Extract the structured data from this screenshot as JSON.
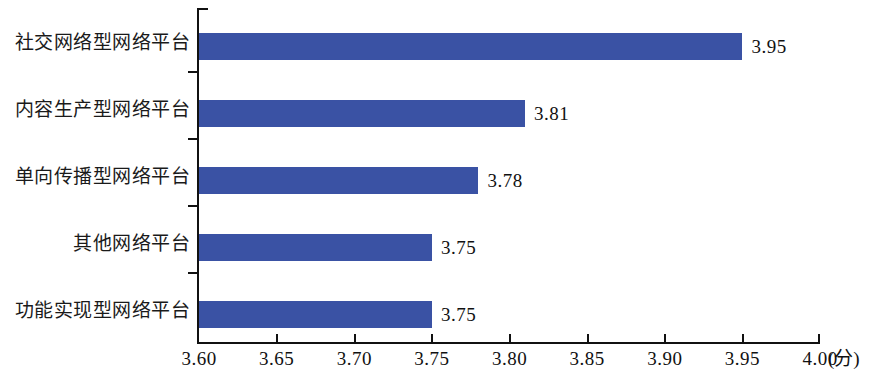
{
  "chart_data": {
    "type": "bar",
    "orientation": "horizontal",
    "title": "",
    "subtitle": "",
    "xlabel": "(分)",
    "ylabel": "",
    "xlim": [
      3.6,
      4.0
    ],
    "grid": false,
    "legend": null,
    "series_color": "#3a52a4",
    "categories": [
      "社交网络型网络平台",
      "内容生产型网络平台",
      "单向传播型网络平台",
      "其他网络平台",
      "功能实现型网络平台"
    ],
    "values": [
      3.95,
      3.81,
      3.78,
      3.75,
      3.75
    ],
    "value_labels": [
      "3.95",
      "3.81",
      "3.78",
      "3.75",
      "3.75"
    ],
    "x_ticks": [
      3.6,
      3.65,
      3.7,
      3.75,
      3.8,
      3.85,
      3.9,
      3.95,
      4.0
    ],
    "x_tick_labels": [
      "3.60",
      "3.65",
      "3.70",
      "3.75",
      "3.80",
      "3.85",
      "3.90",
      "3.95",
      "4.00"
    ]
  }
}
